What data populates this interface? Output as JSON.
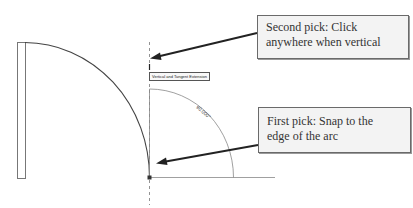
{
  "callouts": {
    "second_pick": {
      "line1": "Second pick: Click",
      "line2": "anywhere when vertical"
    },
    "first_pick": {
      "line1": "First pick: Snap to the",
      "line2": "edge of the arc"
    }
  },
  "drawing": {
    "snap_tooltip": "Vertical and Tangent Extension",
    "angle_dimension": "90.000°"
  },
  "colors": {
    "background": "#ffffff",
    "geometry": "#555555",
    "arrow": "#222222",
    "callout_fill": "#f3f3f3",
    "callout_border": "#6a6a6a"
  }
}
